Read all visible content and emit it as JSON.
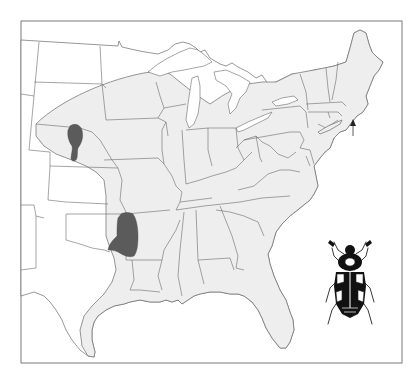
{
  "map": {
    "title": "",
    "region": "Eastern United States",
    "legend": [],
    "layers": {
      "historic_range": {
        "description": "light gray shaded area",
        "color": "#eeeeee"
      },
      "current_populations": {
        "description": "dark gray patches",
        "color": "#5b5b5b",
        "count": 2
      },
      "outside_range": {
        "color": "#ffffff"
      }
    },
    "markers": [
      {
        "type": "arrow-up",
        "location": "Block Island, Rhode Island",
        "color": "#333333"
      }
    ],
    "illustration": {
      "subject": "beetle",
      "style": "black and white line drawing"
    },
    "frame_color": "#7a7a7a",
    "border_color": "#6a6a6a"
  }
}
